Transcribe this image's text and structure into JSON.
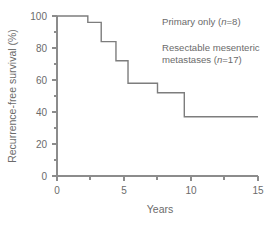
{
  "figure": {
    "width": 280,
    "height": 225,
    "background": "#ffffff",
    "line_color": "#7d7d7d",
    "axis_color": "#8c8c8c",
    "text_color": "#6b6b6b"
  },
  "axes": {
    "x": {
      "label": "Years",
      "ticks": [
        "0",
        "5",
        "10",
        "15"
      ],
      "tick_values": [
        0,
        5,
        10,
        15
      ],
      "minor_tick_values": [
        2.5,
        7.5,
        12.5
      ],
      "range": [
        0,
        15
      ]
    },
    "y": {
      "label": "Recurrence-free survival (%)",
      "ticks": [
        "0",
        "20",
        "40",
        "60",
        "80",
        "100"
      ],
      "tick_values": [
        0,
        20,
        40,
        60,
        80,
        100
      ],
      "minor_tick_values": [
        10,
        30,
        50,
        70,
        90
      ],
      "range": [
        0,
        100
      ]
    }
  },
  "legend": {
    "primary": {
      "text_before": "Primary only (",
      "italic": "n",
      "text_after": "=8)",
      "full": "Primary only (n=8)",
      "n": 8
    },
    "resectable": {
      "text_before": "Resectable mesenteric\nmetastases (",
      "italic": "n",
      "text_after": "=17)",
      "full": "Resectable mesenteric metastases (n=17)",
      "n": 17
    }
  },
  "chart_data": {
    "type": "line",
    "subtype": "kaplan-meier-step",
    "title": "",
    "xlabel": "Years",
    "ylabel": "Recurrence-free survival (%)",
    "xlim": [
      0,
      15
    ],
    "ylim": [
      0,
      100
    ],
    "grid": false,
    "legend_position": "inside-top-right",
    "series": [
      {
        "name": "Resectable mesenteric metastases (n=17)",
        "color": "#7d7d7d",
        "x": [
          0,
          2.3,
          2.3,
          3.3,
          3.3,
          4.4,
          4.4,
          5.3,
          5.3,
          7.5,
          7.5,
          9.5,
          9.5,
          15
        ],
        "y": [
          100,
          100,
          96,
          96,
          84,
          84,
          72,
          72,
          58,
          58,
          52,
          52,
          37,
          37
        ],
        "steps": [
          {
            "time": 2.3,
            "from": 100,
            "to": 96
          },
          {
            "time": 3.3,
            "from": 96,
            "to": 84
          },
          {
            "time": 4.4,
            "from": 84,
            "to": 72
          },
          {
            "time": 5.3,
            "from": 72,
            "to": 58
          },
          {
            "time": 7.5,
            "from": 58,
            "to": 52
          },
          {
            "time": 9.5,
            "from": 52,
            "to": 37
          }
        ],
        "final_value": 37
      }
    ]
  }
}
